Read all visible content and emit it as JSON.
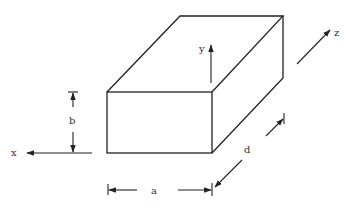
{
  "diagram": {
    "type": "3d-rectangular-box",
    "stroke_color": "#222222",
    "labels": {
      "x_axis": "x",
      "y_axis": "y",
      "z_axis": "z",
      "width": "a",
      "height": "b",
      "depth": "d"
    }
  }
}
